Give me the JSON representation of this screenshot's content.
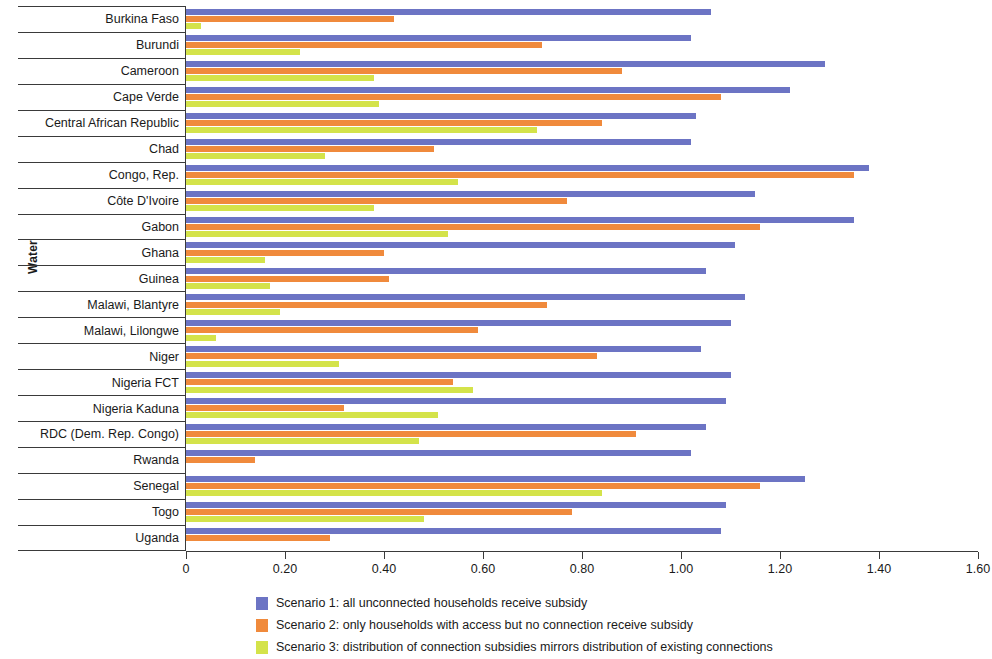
{
  "chart_data": {
    "type": "bar",
    "orientation": "horizontal",
    "title": "",
    "xlabel": "",
    "ylabel": "Water",
    "xlim": [
      0,
      1.6
    ],
    "xticks": [
      "0",
      "0.20",
      "0.40",
      "0.60",
      "0.80",
      "1.00",
      "1.20",
      "1.40",
      "1.60"
    ],
    "xtick_values": [
      0,
      0.2,
      0.4,
      0.6,
      0.8,
      1.0,
      1.2,
      1.4,
      1.6
    ],
    "grid": false,
    "legend_position": "bottom",
    "categories": [
      "Burkina Faso",
      "Burundi",
      "Cameroon",
      "Cape Verde",
      "Central African Republic",
      "Chad",
      "Congo, Rep.",
      "Côte D'Ivoire",
      "Gabon",
      "Ghana",
      "Guinea",
      "Malawi, Blantyre",
      "Malawi, Lilongwe",
      "Niger",
      "Nigeria  FCT",
      "Nigeria Kaduna",
      "RDC (Dem. Rep. Congo)",
      "Rwanda",
      "Senegal",
      "Togo",
      "Uganda"
    ],
    "series": [
      {
        "name": "Scenario 1: all unconnected households receive subsidy",
        "short": "Scenario 1",
        "color": "#6C74C4",
        "values": [
          1.06,
          1.02,
          1.29,
          1.22,
          1.03,
          1.02,
          1.38,
          1.15,
          1.35,
          1.11,
          1.05,
          1.13,
          1.1,
          1.04,
          1.1,
          1.09,
          1.05,
          1.02,
          1.25,
          1.09,
          1.08
        ]
      },
      {
        "name": "Scenario 2: only households with access but no connection receive subsidy",
        "short": "Scenario 2",
        "color": "#F08A3C",
        "values": [
          0.42,
          0.72,
          0.88,
          1.08,
          0.84,
          0.5,
          1.35,
          0.77,
          1.16,
          0.4,
          0.41,
          0.73,
          0.59,
          0.83,
          0.54,
          0.32,
          0.91,
          0.14,
          1.16,
          0.78,
          0.29
        ]
      },
      {
        "name": "Scenario 3: distribution of connection subsidies mirrors distribution of existing connections",
        "short": "Scenario 3",
        "color": "#D4E34A",
        "values": [
          0.03,
          0.23,
          0.38,
          0.39,
          0.71,
          0.28,
          0.55,
          0.38,
          0.53,
          0.16,
          0.17,
          0.19,
          0.06,
          0.31,
          0.58,
          0.51,
          0.47,
          0.0,
          0.84,
          0.48,
          0.0
        ]
      }
    ]
  }
}
